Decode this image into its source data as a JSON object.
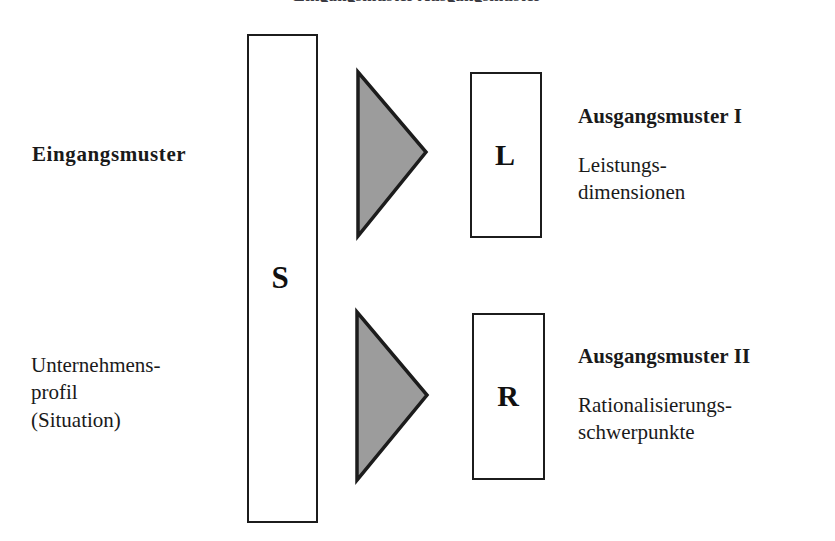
{
  "page": {
    "background_color": "#ffffff",
    "width": 835,
    "height": 541,
    "cropped_header_line": "Eingangsmuster  Ausgangsmuster"
  },
  "diagram": {
    "colors": {
      "stroke": "#1c1c1c",
      "triangle_fill": "#9c9c9c",
      "triangle_stroke": "#1c1c1c",
      "text": "#1a1a1a",
      "box_fill": "#ffffff"
    },
    "input_side": {
      "heading": "Eingangsmuster",
      "description_lines": [
        "Unternehmens-",
        "profil",
        "(Situation)"
      ]
    },
    "center_box": {
      "letter": "S"
    },
    "branches": [
      {
        "arrow_name": "arrow-to-l",
        "box_letter": "L",
        "heading": "Ausgangsmuster I",
        "description_lines": [
          "Leistungs-",
          "dimensionen"
        ]
      },
      {
        "arrow_name": "arrow-to-r",
        "box_letter": "R",
        "heading": "Ausgangsmuster II",
        "description_lines": [
          "Rationalisierungs-",
          "schwerpunkte"
        ]
      }
    ]
  }
}
